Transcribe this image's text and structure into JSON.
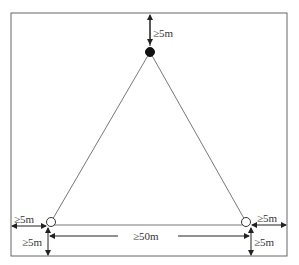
{
  "diagram": {
    "type": "site-layout",
    "colors": {
      "line": "#555555",
      "text": "#333333",
      "filled_node": "#111111",
      "open_node": "#ffffff"
    },
    "nodes": [
      {
        "id": "top",
        "style": "filled"
      },
      {
        "id": "bottom-left",
        "style": "open"
      },
      {
        "id": "bottom-right",
        "style": "open"
      }
    ],
    "labels": {
      "top_clearance": "≥5m",
      "left_clearance": "≥5m",
      "left_bottom_clearance": "≥5m",
      "right_clearance": "≥5m",
      "right_bottom_clearance": "≥5m",
      "baseline_distance": "≥50m"
    }
  }
}
